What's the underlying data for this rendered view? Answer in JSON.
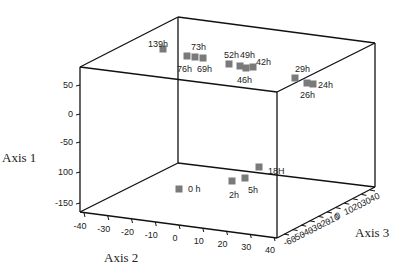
{
  "chart_data": {
    "type": "scatter3d",
    "title": "",
    "axes": {
      "axis1": {
        "label": "Axis 1",
        "range": [
          -160,
          80
        ],
        "ticks": [
          50,
          0,
          -50,
          -100,
          -150
        ],
        "tick_labels": [
          "50",
          "0",
          "-50",
          "100",
          "-150"
        ]
      },
      "axis2": {
        "label": "Axis 2",
        "range": [
          -40,
          40
        ],
        "ticks": [
          -40,
          -30,
          -20,
          -10,
          0,
          10,
          20,
          30,
          40
        ],
        "tick_labels": [
          "-40",
          "-30",
          "-20",
          "-10",
          "0",
          "10",
          "20",
          "30",
          "40"
        ]
      },
      "axis3": {
        "label": "Axis 3",
        "range": [
          -60,
          40
        ],
        "ticks": [
          -60,
          -50,
          -40,
          -30,
          -20,
          -10,
          0,
          10,
          20,
          30,
          40
        ],
        "tick_labels": [
          "-60",
          "-50",
          "-40",
          "-30",
          "-20",
          "-10",
          "0",
          "10",
          "20",
          "30",
          "40"
        ]
      }
    },
    "grid": false,
    "legend": null,
    "marker": {
      "shape": "square",
      "color": "#7a7a7a"
    },
    "points": [
      {
        "label": "139h",
        "screen": [
          163,
          49
        ],
        "label_pos": [
          148,
          44
        ]
      },
      {
        "label": "73h",
        "screen": [
          187,
          56
        ],
        "label_pos": [
          191,
          47
        ]
      },
      {
        "label": "76h",
        "screen": [
          195,
          57
        ],
        "label_pos": [
          177,
          69
        ]
      },
      {
        "label": "69h",
        "screen": [
          203,
          58
        ],
        "label_pos": [
          197,
          69
        ]
      },
      {
        "label": "52h",
        "screen": [
          229,
          64
        ],
        "label_pos": [
          224,
          55
        ]
      },
      {
        "label": "49h",
        "screen": [
          240,
          66
        ],
        "label_pos": [
          240,
          55
        ]
      },
      {
        "label": "46h",
        "screen": [
          246,
          68
        ],
        "label_pos": [
          237,
          80
        ]
      },
      {
        "label": "42h",
        "screen": [
          253,
          67
        ],
        "label_pos": [
          256,
          62
        ]
      },
      {
        "label": "29h",
        "screen": [
          295,
          78
        ],
        "label_pos": [
          295,
          69
        ]
      },
      {
        "label": "26h",
        "screen": [
          307,
          83
        ],
        "label_pos": [
          300,
          95
        ]
      },
      {
        "label": "24h",
        "screen": [
          313,
          84
        ],
        "label_pos": [
          318,
          85
        ]
      },
      {
        "label": "18H",
        "screen": [
          259,
          167
        ],
        "label_pos": [
          268,
          171
        ]
      },
      {
        "label": "5h",
        "screen": [
          245,
          178
        ],
        "label_pos": [
          248,
          190
        ]
      },
      {
        "label": "2h",
        "screen": [
          232,
          181
        ],
        "label_pos": [
          229,
          195
        ]
      },
      {
        "label": "0 h",
        "screen": [
          179,
          189
        ],
        "label_pos": [
          188,
          189
        ]
      }
    ]
  },
  "frame": {
    "top_back_left": [
      178,
      17
    ],
    "top_back_right": [
      375,
      43
    ],
    "top_front_left": [
      80,
      67
    ],
    "top_front_right": [
      277,
      92
    ],
    "bottom_back_left": [
      178,
      163
    ],
    "bottom_back_right": [
      375,
      187
    ],
    "bottom_front_left": [
      80,
      212
    ],
    "bottom_front_right": [
      277,
      238
    ]
  }
}
